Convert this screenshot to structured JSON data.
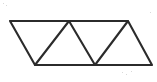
{
  "figure": {
    "shape_name": "triangulated-parallelogram",
    "background_color": "#ffffff",
    "line_color": "#2b2b2b",
    "line_width": 2.1,
    "canvas": {
      "width": 157,
      "height": 82
    },
    "labels": {
      "none": ""
    }
  },
  "chart_data": {
    "type": "diagram",
    "units": "pixels",
    "vertices": {
      "top_left": [
        10,
        21
      ],
      "top_mid": [
        69,
        21
      ],
      "top_right": [
        128,
        21
      ],
      "bottom_left": [
        35,
        65
      ],
      "bottom_mid": [
        95,
        65
      ],
      "bottom_right": [
        152,
        65
      ]
    },
    "outline_polygon": [
      [
        10,
        21
      ],
      [
        128,
        21
      ],
      [
        152,
        65
      ],
      [
        35,
        65
      ]
    ],
    "edges": [
      {
        "name": "top-edge",
        "from": [
          10,
          21
        ],
        "to": [
          128,
          21
        ]
      },
      {
        "name": "bottom-edge",
        "from": [
          35,
          65
        ],
        "to": [
          152,
          65
        ]
      },
      {
        "name": "left-edge",
        "from": [
          10,
          21
        ],
        "to": [
          35,
          65
        ]
      },
      {
        "name": "right-edge",
        "from": [
          128,
          21
        ],
        "to": [
          152,
          65
        ]
      },
      {
        "name": "diagonal-1",
        "from": [
          35,
          65
        ],
        "to": [
          69,
          21
        ]
      },
      {
        "name": "diagonal-2",
        "from": [
          69,
          21
        ],
        "to": [
          95,
          65
        ]
      },
      {
        "name": "diagonal-3",
        "from": [
          95,
          65
        ],
        "to": [
          128,
          21
        ]
      }
    ],
    "triangles": [
      {
        "name": "triangle-1-down",
        "orientation": "down",
        "points": [
          [
            10,
            21
          ],
          [
            69,
            21
          ],
          [
            35,
            65
          ]
        ]
      },
      {
        "name": "triangle-2-up",
        "orientation": "up",
        "points": [
          [
            35,
            65
          ],
          [
            69,
            21
          ],
          [
            95,
            65
          ]
        ]
      },
      {
        "name": "triangle-3-down",
        "orientation": "down",
        "points": [
          [
            69,
            21
          ],
          [
            128,
            21
          ],
          [
            95,
            65
          ]
        ]
      },
      {
        "name": "triangle-4-up",
        "orientation": "up",
        "points": [
          [
            95,
            65
          ],
          [
            128,
            21
          ],
          [
            152,
            65
          ]
        ]
      }
    ],
    "triangle_count": 4,
    "grid": false,
    "legend": null,
    "annotations": []
  }
}
